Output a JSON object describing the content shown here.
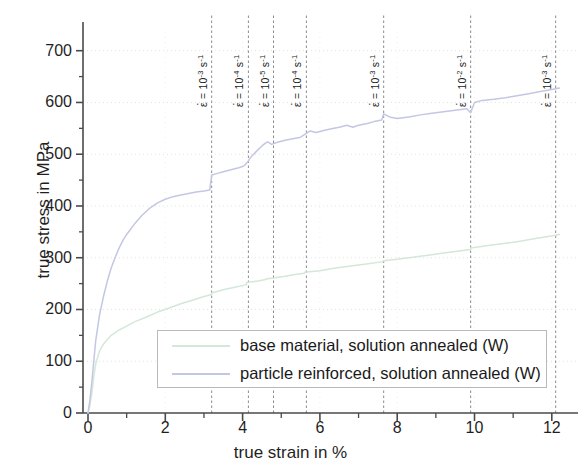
{
  "chart_data": {
    "type": "line",
    "title": "",
    "xlabel": "true strain in %",
    "ylabel": "true stress in MPa",
    "xlim": [
      0,
      12.6
    ],
    "ylim": [
      0,
      740
    ],
    "xticks": [
      0,
      2,
      4,
      6,
      8,
      10,
      12
    ],
    "yticks": [
      0,
      100,
      200,
      300,
      400,
      500,
      600,
      700
    ],
    "xtick_labels": [
      "0",
      "2",
      "4",
      "6",
      "8",
      "10",
      "12"
    ],
    "ytick_labels": [
      "0",
      "100",
      "200",
      "300",
      "400",
      "500",
      "600",
      "700"
    ],
    "xminor_step": 0.5,
    "yminor_step": 50,
    "grid": true,
    "legend_position": "lower center inside",
    "series": [
      {
        "name": "base material, solution annealed (W)",
        "color": "#d3e8d8",
        "points": [
          [
            0.0,
            0
          ],
          [
            0.05,
            15
          ],
          [
            0.1,
            40
          ],
          [
            0.15,
            70
          ],
          [
            0.2,
            95
          ],
          [
            0.3,
            120
          ],
          [
            0.4,
            133
          ],
          [
            0.5,
            142
          ],
          [
            0.6,
            150
          ],
          [
            0.8,
            160
          ],
          [
            1.0,
            168
          ],
          [
            1.2,
            176
          ],
          [
            1.5,
            185
          ],
          [
            1.8,
            195
          ],
          [
            2.1,
            203
          ],
          [
            2.4,
            211
          ],
          [
            2.7,
            218
          ],
          [
            3.0,
            225
          ],
          [
            3.2,
            229
          ],
          [
            3.2,
            232
          ],
          [
            3.5,
            238
          ],
          [
            3.8,
            243
          ],
          [
            4.1,
            248
          ],
          [
            4.1,
            252
          ],
          [
            4.4,
            255
          ],
          [
            4.6,
            258
          ],
          [
            4.6,
            259
          ],
          [
            4.8,
            261
          ],
          [
            5.1,
            264
          ],
          [
            5.4,
            268
          ],
          [
            5.6,
            270
          ],
          [
            5.6,
            272
          ],
          [
            6.0,
            275
          ],
          [
            6.4,
            280
          ],
          [
            6.8,
            284
          ],
          [
            7.2,
            288
          ],
          [
            7.6,
            292
          ],
          [
            7.65,
            294
          ],
          [
            8.0,
            297
          ],
          [
            8.4,
            301
          ],
          [
            8.8,
            305
          ],
          [
            9.2,
            309
          ],
          [
            9.6,
            313
          ],
          [
            9.9,
            316
          ],
          [
            9.9,
            319
          ],
          [
            10.3,
            323
          ],
          [
            10.7,
            327
          ],
          [
            11.1,
            331
          ],
          [
            11.5,
            336
          ],
          [
            11.9,
            341
          ],
          [
            12.2,
            345
          ]
        ]
      },
      {
        "name": "particle reinforced, solution annealed (W)",
        "color": "#c3c7e4",
        "points": [
          [
            0.0,
            0
          ],
          [
            0.05,
            25
          ],
          [
            0.1,
            60
          ],
          [
            0.15,
            100
          ],
          [
            0.2,
            140
          ],
          [
            0.3,
            190
          ],
          [
            0.4,
            225
          ],
          [
            0.5,
            255
          ],
          [
            0.6,
            280
          ],
          [
            0.7,
            300
          ],
          [
            0.8,
            318
          ],
          [
            0.9,
            333
          ],
          [
            1.0,
            345
          ],
          [
            1.2,
            365
          ],
          [
            1.4,
            382
          ],
          [
            1.6,
            396
          ],
          [
            1.8,
            406
          ],
          [
            2.0,
            413
          ],
          [
            2.2,
            418
          ],
          [
            2.4,
            421
          ],
          [
            2.6,
            424
          ],
          [
            2.8,
            427
          ],
          [
            3.0,
            429
          ],
          [
            3.15,
            431
          ],
          [
            3.2,
            460
          ],
          [
            3.35,
            463
          ],
          [
            3.5,
            466
          ],
          [
            3.7,
            470
          ],
          [
            3.9,
            474
          ],
          [
            4.05,
            478
          ],
          [
            4.15,
            487
          ],
          [
            4.2,
            493
          ],
          [
            4.35,
            505
          ],
          [
            4.5,
            516
          ],
          [
            4.6,
            522
          ],
          [
            4.65,
            524
          ],
          [
            4.75,
            519
          ],
          [
            4.9,
            523
          ],
          [
            5.1,
            527
          ],
          [
            5.3,
            530
          ],
          [
            5.5,
            533
          ],
          [
            5.6,
            538
          ],
          [
            5.75,
            545
          ],
          [
            5.9,
            542
          ],
          [
            6.1,
            546
          ],
          [
            6.3,
            549
          ],
          [
            6.5,
            552
          ],
          [
            6.7,
            556
          ],
          [
            6.85,
            552
          ],
          [
            7.0,
            556
          ],
          [
            7.2,
            559
          ],
          [
            7.4,
            563
          ],
          [
            7.6,
            566
          ],
          [
            7.65,
            578
          ],
          [
            7.8,
            572
          ],
          [
            8.0,
            569
          ],
          [
            8.3,
            572
          ],
          [
            8.6,
            576
          ],
          [
            8.9,
            579
          ],
          [
            9.2,
            582
          ],
          [
            9.5,
            585
          ],
          [
            9.8,
            588
          ],
          [
            9.9,
            580
          ],
          [
            10.0,
            600
          ],
          [
            10.2,
            604
          ],
          [
            10.5,
            606
          ],
          [
            10.8,
            609
          ],
          [
            11.1,
            613
          ],
          [
            11.4,
            617
          ],
          [
            11.7,
            621
          ],
          [
            12.0,
            625
          ],
          [
            12.2,
            628
          ]
        ]
      }
    ],
    "rate_markers": [
      {
        "x": 3.2,
        "value": "10",
        "exponent": "-3",
        "unit": "s",
        "unit_exp": "-1",
        "label": "ε = 10⁻³ s⁻¹"
      },
      {
        "x": 4.15,
        "value": "10",
        "exponent": "-4",
        "unit": "s",
        "unit_exp": "-1",
        "label": "ε = 10⁻⁴ s⁻¹"
      },
      {
        "x": 4.8,
        "value": "10",
        "exponent": "-5",
        "unit": "s",
        "unit_exp": "-1",
        "label": "ε = 10⁻⁵ s⁻¹"
      },
      {
        "x": 5.65,
        "value": "10",
        "exponent": "-4",
        "unit": "s",
        "unit_exp": "-1",
        "label": "ε = 10⁻⁴ s⁻¹"
      },
      {
        "x": 7.65,
        "value": "10",
        "exponent": "-3",
        "unit": "s",
        "unit_exp": "-1",
        "label": "ε = 10⁻³ s⁻¹"
      },
      {
        "x": 9.9,
        "value": "10",
        "exponent": "-2",
        "unit": "s",
        "unit_exp": "-1",
        "label": "ε = 10⁻² s⁻¹"
      },
      {
        "x": 12.1,
        "value": "10",
        "exponent": "-3",
        "unit": "s",
        "unit_exp": "-1",
        "label": "ε = 10⁻³ s⁻¹"
      }
    ]
  },
  "legend": {
    "entries": [
      {
        "label": "base material, solution annealed (W)"
      },
      {
        "label": "particle reinforced, solution annealed (W)"
      }
    ]
  },
  "axes": {
    "x_title": "true strain in %",
    "y_title": "true stress in MPa"
  },
  "colors": {
    "base_material": "#d3e8d8",
    "particle_reinforced": "#c3c7e4",
    "axis": "#4a4a4a",
    "grid": "#e2e2e2",
    "marker_line": "#8a8a8a"
  }
}
